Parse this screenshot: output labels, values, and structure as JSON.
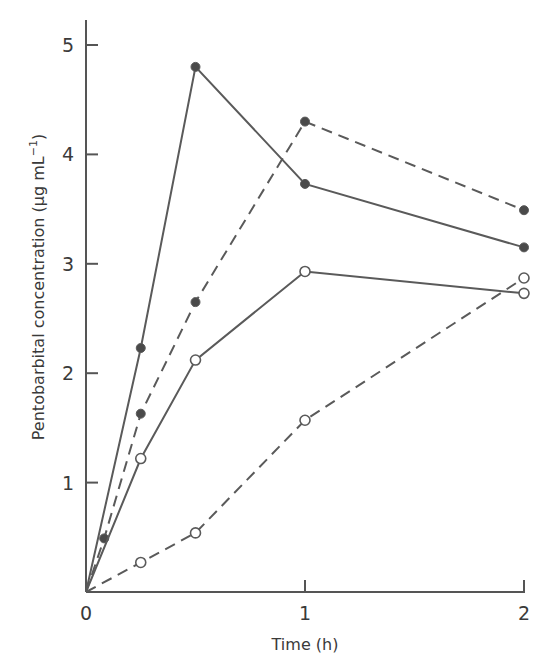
{
  "chart_data": {
    "type": "line",
    "title": "",
    "xlabel": "Time (h)",
    "ylabel": "Pentobarbital concentration (µg mL⁻¹)",
    "ylabel_main": "Pentobarbital concentration (µg mL",
    "ylabel_sup": "−1",
    "ylabel_close": ")",
    "xlim": [
      0,
      2
    ],
    "ylim": [
      0,
      5
    ],
    "x_ticks": [
      0,
      1,
      2
    ],
    "x_tick_labels": [
      "0",
      "1",
      "2"
    ],
    "y_ticks": [
      1,
      2,
      3,
      4,
      5
    ],
    "y_tick_labels": [
      "1",
      "2",
      "3",
      "4",
      "5"
    ],
    "grid": false,
    "legend": null,
    "series": [
      {
        "name": "filled-solid",
        "marker": "filled-circle",
        "line": "solid",
        "x": [
          0,
          0.25,
          0.5,
          1,
          2
        ],
        "y": [
          0,
          2.23,
          4.8,
          3.73,
          3.15
        ]
      },
      {
        "name": "filled-dashed",
        "marker": "filled-circle",
        "line": "dashed",
        "x": [
          0,
          0.083,
          0.25,
          0.5,
          1,
          2
        ],
        "y": [
          0,
          0.49,
          1.63,
          2.65,
          4.3,
          3.49
        ]
      },
      {
        "name": "open-solid",
        "marker": "open-circle",
        "line": "solid",
        "x": [
          0,
          0.25,
          0.5,
          1,
          2
        ],
        "y": [
          0,
          1.22,
          2.12,
          2.93,
          2.73
        ]
      },
      {
        "name": "open-dashed",
        "marker": "open-circle",
        "line": "dashed",
        "x": [
          0,
          0.25,
          0.5,
          1,
          2
        ],
        "y": [
          0,
          0.27,
          0.54,
          1.57,
          2.87
        ]
      }
    ]
  },
  "colors": {
    "axis": "#555555",
    "line": "#5a5a5a",
    "marker_fill": "#4a4a4a",
    "text": "#3a3a3a",
    "background": "#ffffff"
  }
}
